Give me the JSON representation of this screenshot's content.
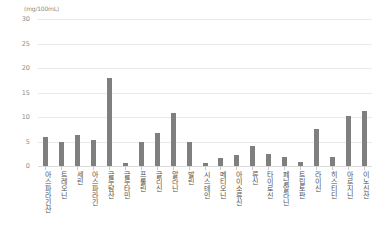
{
  "chart_data": {
    "type": "bar",
    "title": "",
    "subtitle": "",
    "xlabel": "",
    "ylabel": "(mg/100mL)",
    "unit_label": "(mg/100mL)",
    "ylim": [
      0,
      30
    ],
    "yticks": [
      30,
      25,
      20,
      15,
      10,
      5,
      0
    ],
    "ytick_labels": [
      "30",
      "25",
      "20",
      "15",
      "10",
      "5",
      "0"
    ],
    "grid": true,
    "legend": false,
    "legend_position": "none",
    "bar_color": "#7f7f7f",
    "gridline_color": "#e9e9e9",
    "background_color": "#ffffff",
    "categories": [
      "아스파라긴산",
      "트레오닌",
      "세린",
      "아스파라긴",
      "글루탐산",
      "글루타민",
      "프롤린",
      "글리신",
      "알라닌",
      "발린",
      "시스테인",
      "메티오닌",
      "아이소류신",
      "류신",
      "타이로신",
      "페닐알라닌",
      "트립토판",
      "라이신",
      "히스티딘",
      "아르지닌",
      "이노신산"
    ],
    "values": [
      6.0,
      5.0,
      6.3,
      5.3,
      18.0,
      0.7,
      4.8,
      6.8,
      10.8,
      4.8,
      0.6,
      1.6,
      2.3,
      4.0,
      2.5,
      1.8,
      0.9,
      7.5,
      1.9,
      10.3,
      11.3
    ]
  }
}
